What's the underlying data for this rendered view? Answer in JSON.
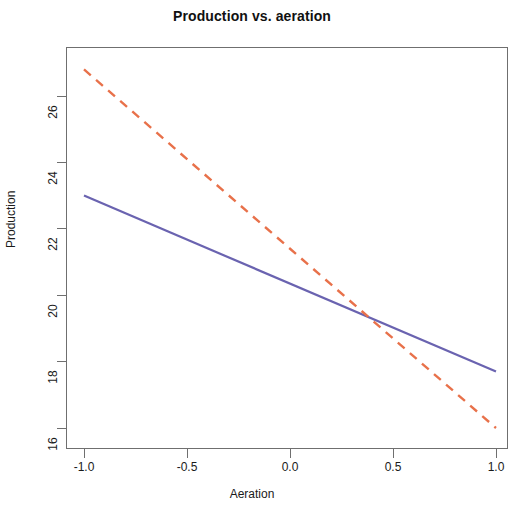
{
  "chart_data": {
    "type": "line",
    "title": "Production vs. aeration",
    "xlabel": "Aeration",
    "ylabel": "Production",
    "xlim": [
      -1.1,
      1.1
    ],
    "ylim": [
      15.5,
      27.2
    ],
    "xticks": [
      "-1.0",
      "-0.5",
      "0.0",
      "0.5",
      "1.0"
    ],
    "xtick_values": [
      -1.0,
      -0.5,
      0.0,
      0.5,
      1.0
    ],
    "yticks": [
      "16",
      "18",
      "20",
      "22",
      "24",
      "26"
    ],
    "ytick_values": [
      16,
      18,
      20,
      22,
      24,
      26
    ],
    "grid": false,
    "legend": "none",
    "x": [
      -1.0,
      1.0
    ],
    "series": [
      {
        "name": "solid-line",
        "style": "solid",
        "color": "#6a63b0",
        "values": [
          23.0,
          17.7
        ]
      },
      {
        "name": "dashed-line",
        "style": "dashed",
        "color": "#e8714a",
        "values": [
          26.8,
          16.0
        ]
      }
    ],
    "annotations": [
      {
        "name": "intersection",
        "x": 0.45,
        "y": 19.2
      }
    ],
    "axis_color": "#6f6f6f",
    "background": "#ffffff"
  }
}
